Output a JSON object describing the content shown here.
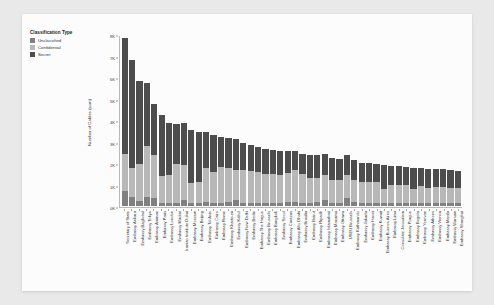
{
  "legend": {
    "title": "Classification Type",
    "items": [
      {
        "label": "Unclassified",
        "color": "#808080"
      },
      {
        "label": "Confidential",
        "color": "#b8b8b8"
      },
      {
        "label": "Secret",
        "color": "#4d4d4d"
      }
    ]
  },
  "chart_data": {
    "type": "bar",
    "stacked": true,
    "title": "",
    "xlabel": "",
    "ylabel": "Number of Cables (sum)",
    "ylim": [
      0,
      8000
    ],
    "yticks": [
      0,
      1000,
      2000,
      3000,
      4000,
      5000,
      6000,
      7000,
      8000
    ],
    "ytick_labels": [
      "0K",
      "1K",
      "2K",
      "3K",
      "4K",
      "5K",
      "6K",
      "7K",
      "8K"
    ],
    "grid": false,
    "legend_position": "top-left",
    "categories": [
      "Secretary of State",
      "Embassy Ankara",
      "Embassy Baghdad",
      "Embassy Tokyo",
      "Embassy Amman",
      "Embassy Paris",
      "Embassy London",
      "Embassy Madrid",
      "Iranian Institute Dubai",
      "Embassy Moscow",
      "Embassy Beijing",
      "Embassy Tel Aviv",
      "Embassy Cairo",
      "Embassy Rome",
      "Embassy Khartoum",
      "Embassy Kabul",
      "Embassy New Delhi",
      "Embassy Berlin",
      "Embassy The Hague",
      "Embassy Brussels",
      "Embassy Bangkok",
      "Embassy Seoul",
      "Embassy Caracas",
      "Embassy Abu Dhabi",
      "Embassy Brasilia",
      "Embassy Beirut",
      "Embassy Riyadh",
      "Embassy Islamabad",
      "Embassy Manama",
      "Embassy Ottawa",
      "USEU Brussels",
      "Embassy Kathmandu",
      "Embassy Jakarta",
      "Embassy Hanoi",
      "Embassy Kuwait",
      "Embassy Buenos Aires",
      "Embassy Lima",
      "Consulate Jerusalem",
      "Embassy Prague",
      "Embassy Bogota",
      "Embassy Yerevan",
      "Embassy Athens",
      "Embassy Vienna",
      "Embassy Manila",
      "Embassy Warsaw",
      "Embassy Shanghai"
    ],
    "series": [
      {
        "name": "Secret",
        "color": "#4d4d4d",
        "values": [
          5450,
          5050,
          3900,
          2980,
          2400,
          2900,
          2450,
          1850,
          1950,
          2500,
          2350,
          1700,
          1750,
          1400,
          1400,
          1450,
          1250,
          1250,
          1200,
          1200,
          1150,
          1150,
          1050,
          900,
          950,
          1050,
          1050,
          1000,
          1000,
          950,
          950,
          900,
          900,
          900,
          850,
          1150,
          900,
          900,
          850,
          1000,
          850,
          900,
          850,
          850,
          850,
          800
        ]
      },
      {
        "name": "Confidential",
        "color": "#b8b8b8",
        "values": [
          1750,
          1350,
          1750,
          2400,
          2000,
          1250,
          1300,
          1850,
          1650,
          950,
          1000,
          1600,
          1450,
          1700,
          1600,
          1400,
          1550,
          1500,
          1450,
          1350,
          1350,
          1300,
          1350,
          1500,
          1350,
          1200,
          1150,
          1150,
          1100,
          1100,
          1050,
          1050,
          1000,
          1000,
          1000,
          650,
          850,
          850,
          850,
          650,
          800,
          700,
          750,
          750,
          700,
          700
        ]
      },
      {
        "name": "Unclassified",
        "color": "#808080",
        "values": [
          700,
          450,
          250,
          420,
          400,
          150,
          150,
          150,
          300,
          150,
          150,
          200,
          150,
          150,
          200,
          300,
          150,
          150,
          150,
          150,
          150,
          150,
          200,
          200,
          150,
          150,
          200,
          300,
          150,
          150,
          400,
          200,
          150,
          150,
          150,
          150,
          150,
          150,
          150,
          150,
          150,
          150,
          150,
          150,
          150,
          150
        ]
      }
    ]
  }
}
